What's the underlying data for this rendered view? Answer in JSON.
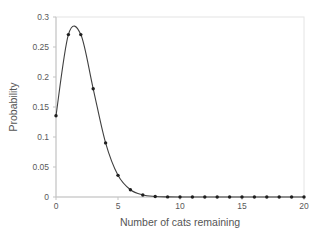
{
  "page": {
    "background_color": "#ffffff"
  },
  "chart_data": {
    "type": "line",
    "title": "",
    "xlabel": "Number of cats remaining",
    "ylabel": "Probability",
    "x": [
      0,
      1,
      2,
      3,
      4,
      5,
      6,
      7,
      8,
      9,
      10,
      11,
      12,
      13,
      14,
      15,
      16,
      17,
      18,
      19,
      20
    ],
    "values": [
      0.1353,
      0.2707,
      0.2707,
      0.1804,
      0.0902,
      0.0361,
      0.012,
      0.0034,
      0.0009,
      0.0002,
      0.0,
      0,
      0,
      0,
      0,
      0,
      0,
      0,
      0,
      0,
      0
    ],
    "xlim": [
      0,
      20
    ],
    "ylim": [
      0,
      0.3
    ],
    "xticks": [
      0,
      5,
      10,
      15,
      20
    ],
    "xtick_labels": [
      "0",
      "5",
      "10",
      "15",
      "20"
    ],
    "yticks": [
      0,
      0.05,
      0.1,
      0.15,
      0.2,
      0.25,
      0.3
    ],
    "ytick_labels": [
      "0",
      "0.05",
      "0.1",
      "0.15",
      "0.2",
      "0.25",
      "0.3"
    ],
    "grid": false,
    "legend": "none",
    "line_style": "smooth",
    "marker": "circle",
    "colors": {
      "line": "#404040",
      "marker": "#1f1f1f",
      "axis": "#c3c3c3",
      "plot_border": "#e4e4e4",
      "tick_text": "#595959",
      "title_text": "#555555"
    }
  }
}
